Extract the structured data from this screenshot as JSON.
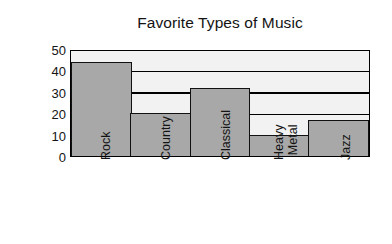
{
  "chart_data": {
    "type": "bar",
    "title": "Favorite Types of Music",
    "xlabel": "",
    "ylabel": "Responses",
    "categories": [
      "Rock",
      "Country",
      "Classical",
      "Heavy Metal",
      "Jazz"
    ],
    "category_lines": [
      [
        "Rock"
      ],
      [
        "Country"
      ],
      [
        "Classical"
      ],
      [
        "Heavy",
        "Metal"
      ],
      [
        "Jazz"
      ]
    ],
    "values": [
      44,
      20,
      32,
      10,
      17
    ],
    "ylim": [
      0,
      50
    ],
    "yticks": [
      50,
      40,
      30,
      20,
      10,
      0
    ],
    "ytick_labels": [
      "50",
      "40",
      "30",
      "20",
      "10",
      "0"
    ],
    "gridlines": [
      10,
      20,
      30,
      40
    ],
    "grid": true,
    "legend": false,
    "legend_position": "none",
    "bar_color": "#a8a8a8",
    "bar_edge_color": "#111111",
    "plot_background": "#f2f2f2",
    "axis_color": "#000000",
    "text_color": "#141414",
    "tick_label_rotation": 90
  }
}
